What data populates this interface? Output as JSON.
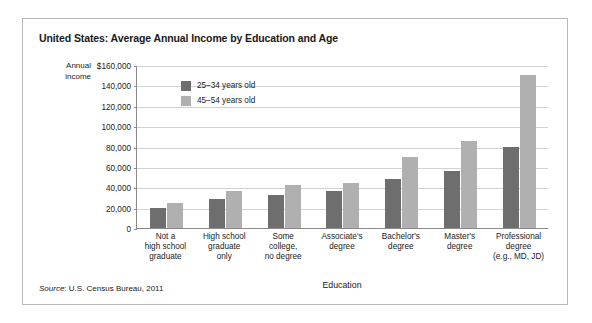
{
  "figure": {
    "title": "United States: Average Annual Income by Education and Age",
    "source_prefix": "Source",
    "source_text": ": U.S. Census Bureau, 2011"
  },
  "colors": {
    "series_young": "#6e6e6e",
    "series_older": "#b0b0b0",
    "gridline": "#d2d2d2",
    "axis": "#8a8a8a",
    "frame": "#b9b9b9"
  },
  "axis": {
    "y_title_line1": "Annual",
    "y_title_line2": "income",
    "x_title": "Education"
  },
  "chart_data": {
    "type": "bar",
    "title": "United States: Average Annual Income by Education and Age",
    "xlabel": "Education",
    "ylabel": "Annual income",
    "ylim": [
      0,
      160000
    ],
    "ytick_labels": [
      "$160,000",
      "140,000",
      "120,000",
      "100,000",
      "80,000",
      "60,000",
      "40,000",
      "20,000",
      "0"
    ],
    "ytick_values": [
      160000,
      140000,
      120000,
      100000,
      80000,
      60000,
      40000,
      20000,
      0
    ],
    "grid": true,
    "legend_position": "upper-left-inside",
    "categories": [
      "Not a\nhigh school\ngraduate",
      "High school\ngraduate\nonly",
      "Some\ncollege,\nno degree",
      "Associate's\ndegree",
      "Bachelor's\ndegree",
      "Master's\ndegree",
      "Professional\ndegree\n(e.g., MD, JD)"
    ],
    "category_lines": [
      [
        "Not a",
        "high school",
        "graduate"
      ],
      [
        "High school",
        "graduate",
        "only"
      ],
      [
        "Some",
        "college,",
        "no degree"
      ],
      [
        "Associate's",
        "degree"
      ],
      [
        "Bachelor's",
        "degree"
      ],
      [
        "Master's",
        "degree"
      ],
      [
        "Professional",
        "degree",
        "(e.g., MD, JD)"
      ]
    ],
    "series": [
      {
        "name": "25–34 years old",
        "color": "#6e6e6e",
        "values": [
          20000,
          28000,
          32000,
          36000,
          48000,
          56000,
          80000
        ]
      },
      {
        "name": "45–54 years old",
        "color": "#b0b0b0",
        "values": [
          25000,
          36000,
          42000,
          44000,
          70000,
          85000,
          150000
        ]
      }
    ]
  },
  "legend": {
    "items": [
      {
        "label": "25–34 years old",
        "color": "#6e6e6e"
      },
      {
        "label": "45–54 years old",
        "color": "#b0b0b0"
      }
    ]
  }
}
